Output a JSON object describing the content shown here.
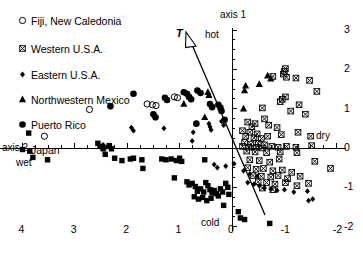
{
  "chart_data": {
    "type": "scatter",
    "title": "",
    "xlabel": "axis 2",
    "ylabel": "axis 1",
    "xlim": [
      4.4,
      -2.2
    ],
    "ylim": [
      -2.2,
      3.1
    ],
    "x_ticks": [
      4,
      3,
      2,
      1,
      0,
      -1,
      -2
    ],
    "y_ticks": [
      3,
      2,
      1,
      0,
      -1,
      -2
    ],
    "x_axis_reversed": true,
    "grid": false,
    "legend_position": "upper-left",
    "axis_anchors": {
      "top": "hot",
      "bottom": "cold",
      "left": "wet",
      "right": "dry"
    },
    "annotations": [
      {
        "text": "T",
        "type": "vector-arrow",
        "direction": "upper-left",
        "x": 0.62,
        "y": 2.75
      }
    ],
    "series": [
      {
        "name": "Fiji, New Caledonia",
        "marker": "open-circle",
        "points": [
          [
            3.58,
            0.3
          ],
          [
            2.72,
            0.98
          ],
          [
            1.62,
            1.12
          ],
          [
            1.52,
            1.1
          ],
          [
            1.45,
            1.08
          ],
          [
            1.1,
            1.3
          ],
          [
            1.04,
            1.28
          ]
        ]
      },
      {
        "name": "Western U.S.A.",
        "marker": "crossed-square",
        "points": [
          [
            -1.02,
            2.02
          ],
          [
            -1.0,
            1.95
          ],
          [
            -0.98,
            1.88
          ],
          [
            -1.04,
            1.8
          ],
          [
            -0.78,
            1.82
          ],
          [
            -1.22,
            1.78
          ],
          [
            -1.48,
            1.72
          ],
          [
            -1.62,
            1.44
          ],
          [
            -1.02,
            1.3
          ],
          [
            -0.96,
            1.24
          ],
          [
            -0.92,
            1.18
          ],
          [
            -1.28,
            1.1
          ],
          [
            -0.58,
            1.02
          ],
          [
            -1.12,
            0.94
          ],
          [
            -1.4,
            0.86
          ],
          [
            -0.62,
            0.74
          ],
          [
            -0.3,
            0.66
          ],
          [
            -0.44,
            0.62
          ],
          [
            -0.38,
            0.54
          ],
          [
            -0.7,
            0.58
          ],
          [
            -0.86,
            0.52
          ],
          [
            -0.2,
            0.44
          ],
          [
            -0.34,
            0.4
          ],
          [
            -0.48,
            0.36
          ],
          [
            -0.26,
            0.3
          ],
          [
            -0.42,
            0.26
          ],
          [
            -0.56,
            0.24
          ],
          [
            -0.68,
            0.3
          ],
          [
            -0.94,
            0.34
          ],
          [
            -1.26,
            0.4
          ],
          [
            -1.5,
            0.3
          ],
          [
            -0.24,
            0.14
          ],
          [
            -0.36,
            0.1
          ],
          [
            -0.5,
            0.12
          ],
          [
            -0.62,
            0.08
          ],
          [
            -0.2,
            0.04
          ],
          [
            -0.32,
            0.02
          ],
          [
            -0.46,
            0.02
          ],
          [
            -0.58,
            0.0
          ],
          [
            -0.76,
            0.04
          ],
          [
            -0.88,
            0.02
          ],
          [
            -1.04,
            0.04
          ],
          [
            -1.22,
            0.02
          ],
          [
            -1.52,
            0.06
          ],
          [
            -0.28,
            -0.08
          ],
          [
            -0.44,
            -0.1
          ],
          [
            -0.66,
            -0.12
          ],
          [
            -0.92,
            -0.1
          ],
          [
            -1.24,
            -0.12
          ],
          [
            -0.34,
            -0.3
          ],
          [
            -0.52,
            -0.32
          ],
          [
            -0.72,
            -0.36
          ],
          [
            -0.9,
            -0.28
          ],
          [
            -1.58,
            -0.34
          ],
          [
            -0.3,
            -0.5
          ],
          [
            -0.46,
            -0.54
          ],
          [
            -0.6,
            -0.52
          ],
          [
            -0.78,
            -0.58
          ],
          [
            -0.96,
            -0.56
          ],
          [
            -1.14,
            -0.62
          ],
          [
            -1.88,
            -0.52
          ],
          [
            -0.4,
            -0.7
          ],
          [
            -0.56,
            -0.72
          ],
          [
            -0.74,
            -0.74
          ],
          [
            -0.88,
            -0.7
          ],
          [
            -1.06,
            -0.78
          ],
          [
            -1.3,
            -0.72
          ],
          [
            -0.5,
            -0.86
          ],
          [
            -0.66,
            -0.88
          ],
          [
            -0.82,
            -0.92
          ],
          [
            -1.02,
            -0.88
          ],
          [
            -1.24,
            -0.96
          ],
          [
            -1.46,
            -0.9
          ],
          [
            -0.58,
            -1.02
          ],
          [
            -0.78,
            -1.06
          ]
        ]
      },
      {
        "name": "Eastern U.S.A.",
        "marker": "small-diamond",
        "points": [
          [
            1.92,
            0.52
          ],
          [
            1.88,
            0.44
          ],
          [
            1.3,
            0.5
          ],
          [
            0.74,
            0.4
          ],
          [
            0.76,
            0.18
          ],
          [
            0.44,
            0.62
          ],
          [
            0.42,
            0.54
          ],
          [
            0.4,
            0.46
          ],
          [
            0.2,
            0.68
          ],
          [
            0.16,
            0.58
          ],
          [
            2.46,
            0.08
          ],
          [
            2.4,
            0.02
          ],
          [
            0.34,
            -0.42
          ],
          [
            0.28,
            -0.5
          ],
          [
            0.12,
            -0.46
          ],
          [
            -0.04,
            -0.4
          ],
          [
            -0.22,
            -0.58
          ],
          [
            -0.34,
            -0.66
          ],
          [
            -0.48,
            -0.72
          ],
          [
            -0.3,
            -0.88
          ],
          [
            -0.42,
            -0.92
          ],
          [
            -0.52,
            -0.96
          ],
          [
            -0.62,
            -1.02
          ],
          [
            -0.74,
            -1.04
          ],
          [
            -0.86,
            -1.08
          ],
          [
            -1.0,
            -1.06
          ],
          [
            -1.18,
            -1.12
          ],
          [
            -1.44,
            -1.1
          ],
          [
            -1.46,
            -1.34
          ],
          [
            -1.54,
            -1.3
          ]
        ]
      },
      {
        "name": "Northwestern Mexico",
        "marker": "filled-triangle",
        "points": [
          [
            -0.68,
            1.84
          ],
          [
            -0.74,
            1.76
          ],
          [
            -0.52,
            1.62
          ],
          [
            -0.26,
            1.58
          ],
          [
            -0.24,
            1.46
          ],
          [
            0.46,
            1.42
          ],
          [
            0.44,
            1.34
          ],
          [
            0.92,
            1.12
          ],
          [
            -0.22,
            1.0
          ],
          [
            0.52,
            0.78
          ]
        ]
      },
      {
        "name": "Puerto Rico",
        "marker": "filled-circle",
        "points": [
          [
            2.32,
            1.06
          ],
          [
            1.88,
            1.38
          ],
          [
            1.28,
            1.28
          ],
          [
            1.24,
            1.22
          ],
          [
            0.92,
            1.42
          ],
          [
            0.86,
            1.38
          ],
          [
            0.82,
            1.3
          ],
          [
            0.78,
            1.24
          ],
          [
            0.66,
            1.46
          ],
          [
            0.6,
            1.4
          ],
          [
            0.42,
            1.12
          ],
          [
            0.38,
            1.04
          ],
          [
            0.26,
            1.1
          ],
          [
            0.22,
            1.02
          ],
          [
            0.2,
            0.94
          ],
          [
            0.14,
            0.72
          ],
          [
            1.5,
            0.86
          ],
          [
            1.46,
            0.78
          ],
          [
            0.68,
            0.62
          ]
        ]
      },
      {
        "name": "Japan",
        "marker": "filled-square",
        "points": [
          [
            3.88,
            0.38
          ],
          [
            3.86,
            -0.08
          ],
          [
            3.8,
            -0.24
          ],
          [
            3.52,
            -0.3
          ],
          [
            2.56,
            0.12
          ],
          [
            2.52,
            0.04
          ],
          [
            2.46,
            -0.02
          ],
          [
            2.42,
            -0.16
          ],
          [
            2.34,
            0.06
          ],
          [
            2.3,
            -0.02
          ],
          [
            2.24,
            -0.26
          ],
          [
            2.1,
            -0.32
          ],
          [
            1.94,
            -0.28
          ],
          [
            1.88,
            -0.26
          ],
          [
            1.72,
            -0.3
          ],
          [
            1.34,
            -0.28
          ],
          [
            1.26,
            -0.3
          ],
          [
            1.16,
            -0.28
          ],
          [
            1.06,
            -0.32
          ],
          [
            1.0,
            -0.26
          ],
          [
            0.96,
            -0.34
          ],
          [
            0.52,
            -0.3
          ],
          [
            1.7,
            -0.52
          ],
          [
            1.1,
            -0.76
          ],
          [
            0.86,
            -0.86
          ],
          [
            0.82,
            -0.94
          ],
          [
            0.76,
            -0.9
          ],
          [
            0.7,
            -0.98
          ],
          [
            0.66,
            -1.1
          ],
          [
            0.6,
            -1.04
          ],
          [
            0.54,
            -1.12
          ],
          [
            0.5,
            -0.88
          ],
          [
            0.46,
            -0.96
          ],
          [
            0.42,
            -1.06
          ],
          [
            0.38,
            -1.14
          ],
          [
            0.34,
            -1.08
          ],
          [
            0.3,
            -1.16
          ],
          [
            0.26,
            -1.22
          ],
          [
            0.22,
            -1.04
          ],
          [
            0.18,
            -1.12
          ],
          [
            0.72,
            -1.24
          ],
          [
            0.64,
            -1.3
          ],
          [
            0.56,
            -1.26
          ],
          [
            0.48,
            -1.34
          ],
          [
            0.4,
            -1.28
          ],
          [
            0.12,
            -0.9
          ],
          [
            0.08,
            -1.0
          ],
          [
            0.06,
            -1.18
          ],
          [
            0.16,
            -1.46
          ],
          [
            -0.12,
            -1.62
          ],
          [
            -0.16,
            -1.78
          ],
          [
            -0.24,
            -1.82
          ],
          [
            -0.72,
            -1.92
          ]
        ]
      }
    ]
  },
  "legend": {
    "items": [
      {
        "label": "Fiji, New Caledonia",
        "marker": "open-circle"
      },
      {
        "label": "Western U.S.A.",
        "marker": "crossed-square"
      },
      {
        "label": "Eastern U.S.A.",
        "marker": "small-diamond"
      },
      {
        "label": "Northwestern Mexico",
        "marker": "filled-triangle"
      },
      {
        "label": "Puerto Rico",
        "marker": "filled-circle"
      },
      {
        "label": "Japan",
        "marker": "filled-square"
      }
    ]
  },
  "labels": {
    "axis1": "axis 1",
    "axis2": "axis 2",
    "hot": "hot",
    "cold": "cold",
    "wet": "wet",
    "dry": "dry",
    "t_vector": "T"
  },
  "ticks": {
    "x": [
      "4",
      "3",
      "2",
      "1",
      "0",
      "-1",
      "-2"
    ],
    "y": [
      "3",
      "2",
      "1",
      "0",
      "-1",
      "-2"
    ]
  },
  "colors": {
    "ink": "#000000",
    "background": "#ffffff"
  }
}
